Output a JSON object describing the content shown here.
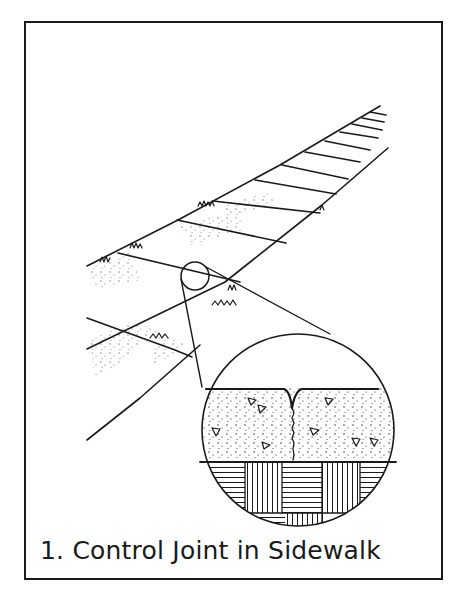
{
  "figure": {
    "caption": "1. Control Joint in Sidewalk",
    "number": 1,
    "subject": "Control Joint in Sidewalk",
    "colors": {
      "ink": "#1a1a1a",
      "paper": "#ffffff"
    },
    "elements": {
      "sidewalk": "perspective view of sidewalk slabs separated by control joints, grass at edges",
      "callout_circle": "small circle marking a joint on the sidewalk",
      "detail_view": "magnified cross-section: concrete with aggregate, V-groove control joint with crack below, over hatched base"
    }
  }
}
